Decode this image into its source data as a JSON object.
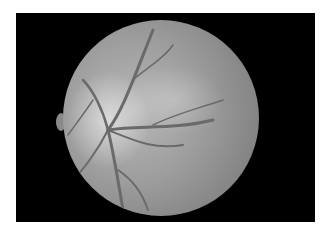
{
  "image": {
    "subject": "grayscale retinal fundus photograph",
    "background_color": "#ffffff",
    "frame_color": "#000000",
    "fundus_tone": "#9c9c9c"
  }
}
